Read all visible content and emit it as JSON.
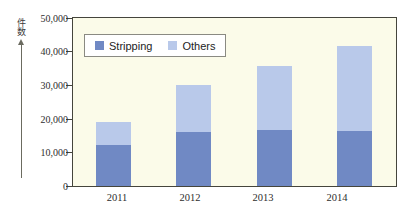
{
  "chart_data": {
    "type": "bar",
    "subtype": "stacked-vertical",
    "title": "",
    "xlabel": "",
    "ylabel": "件数",
    "categories": [
      "2011",
      "2012",
      "2013",
      "2014"
    ],
    "series": [
      {
        "name": "Stripping",
        "color": "#7089c4",
        "values": [
          12300,
          16200,
          16800,
          16500
        ]
      },
      {
        "name": "Others",
        "color": "#b9c9ea",
        "values": [
          6800,
          14000,
          19000,
          25500
        ]
      }
    ],
    "totals": [
      19100,
      30200,
      35800,
      42000
    ],
    "ylim": [
      0,
      50000
    ],
    "ytick_values": [
      0,
      10000,
      20000,
      30000,
      40000,
      50000
    ],
    "ytick_labels": [
      "0",
      "10,000",
      "20,000",
      "30,000",
      "40,000",
      "50,000"
    ],
    "grid": false,
    "legend_position": "upper-left-inside",
    "plot_background": "#fbfbe9",
    "frame_color": "#45453c"
  },
  "axis": {
    "y_caption": "件数",
    "y_arrow": "up-arrow-icon",
    "y_labels": [
      "50,000",
      "40,000",
      "30,000",
      "20,000",
      "10,000",
      "0"
    ],
    "x_labels": [
      "2011",
      "2012",
      "2013",
      "2014"
    ]
  },
  "legend": {
    "items": [
      {
        "label": "Stripping",
        "color": "#7089c4"
      },
      {
        "label": "Others",
        "color": "#b9c9ea"
      }
    ]
  }
}
